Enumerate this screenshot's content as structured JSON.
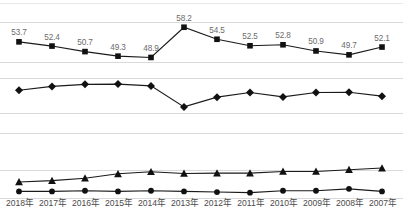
{
  "chart_data": {
    "type": "line",
    "title": "",
    "xlabel": "",
    "ylabel": "",
    "grid": true,
    "legend": "none",
    "categories": [
      "2018年",
      "2017年",
      "2016年",
      "2015年",
      "2014年",
      "2013年",
      "2012年",
      "2011年",
      "2010年",
      "2009年",
      "2008年",
      "2007年"
    ],
    "panels": [
      {
        "name": "panel-1-square-series",
        "marker": "square",
        "labels_shown": true,
        "values": [
          53.7,
          52.4,
          50.7,
          49.3,
          48.9,
          58.2,
          54.5,
          52.5,
          52.8,
          50.9,
          49.7,
          52.1
        ],
        "value_labels": [
          "53.7",
          "52.4",
          "50.7",
          "49.3",
          "48.9",
          "58.2",
          "54.5",
          "52.5",
          "52.8",
          "50.9",
          "49.7",
          "52.1"
        ],
        "ylim": [
          47.5,
          59.5
        ]
      },
      {
        "name": "panel-2-diamond-series",
        "marker": "diamond",
        "labels_shown": false,
        "values": [
          30.5,
          32.0,
          32.8,
          32.9,
          32.2,
          24.0,
          27.8,
          29.6,
          27.9,
          29.6,
          29.7,
          28.2
        ],
        "ylim": [
          22.0,
          34.5
        ]
      },
      {
        "name": "panel-3-triangle-series",
        "marker": "triangle",
        "labels_shown": false,
        "values": [
          10.2,
          10.6,
          11.3,
          12.6,
          13.2,
          12.7,
          12.8,
          12.8,
          13.3,
          13.3,
          13.8,
          14.3
        ],
        "ylim": [
          9.0,
          15.5
        ]
      },
      {
        "name": "panel-4-circle-series",
        "marker": "circle",
        "labels_shown": false,
        "values": [
          4.0,
          4.0,
          4.1,
          4.0,
          4.1,
          4.0,
          3.9,
          3.8,
          4.1,
          4.1,
          4.4,
          4.0
        ],
        "ylim": [
          3.2,
          5.0
        ]
      }
    ],
    "colors": {
      "marker": "#111111",
      "line": "#1a1a1a",
      "gridline": "#d9d9d9",
      "data_label": "#6b6b6b",
      "tick_label": "#4a4a4a",
      "background": "#ffffff"
    },
    "gridline_y": [
      3,
      22,
      62,
      78,
      113,
      133,
      170,
      198
    ]
  }
}
